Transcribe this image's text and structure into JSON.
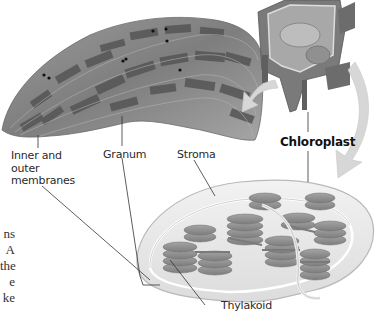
{
  "figure": {
    "labels": {
      "inner_outer_membranes": [
        "Inner and",
        "outer",
        "membranes"
      ],
      "granum": "Granum",
      "stroma": "Stroma",
      "chloroplast": "Chloroplast",
      "thylakoid": "Thylakoid"
    },
    "truncated_body_text": [
      "ns",
      "A",
      "the",
      "e",
      "ke"
    ],
    "panels": [
      "micrograph-chloroplast",
      "plant-cell-cutaway",
      "chloroplast-3d-cutaway"
    ],
    "colors": {
      "micrograph_base": "#8f8f8f",
      "micrograph_dark": "#4a4a4a",
      "granum_stack": "#8a8a8a",
      "arrow": "#d6d6d6",
      "leader_line": "#333333"
    }
  }
}
